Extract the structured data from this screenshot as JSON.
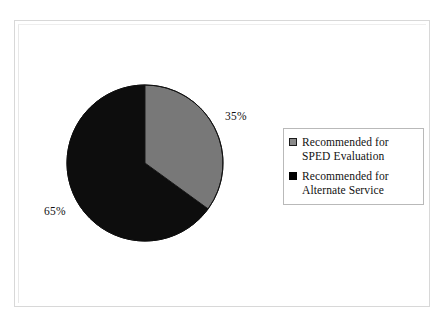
{
  "chart_data": {
    "type": "pie",
    "title": "",
    "categories": [
      "Recommended for SPED Evaluation",
      "Recommended for Alternate Service"
    ],
    "values": [
      35,
      65
    ],
    "unit": "%",
    "slices": [
      {
        "label": "Recommended for SPED Evaluation",
        "value": 35,
        "value_label": "35%",
        "color": "#787878",
        "start_angle_deg": 0,
        "sweep_deg": 126
      },
      {
        "label": "Recommended for Alternate Service",
        "value": 65,
        "value_label": "65%",
        "color": "#0d0d0d",
        "start_angle_deg": 126,
        "sweep_deg": 234
      }
    ],
    "legend": {
      "position": "right",
      "entries": [
        {
          "label": "Recommended for SPED Evaluation",
          "swatch": "gray-outlined-square",
          "color": "#8a8a8a"
        },
        {
          "label": "Recommended for Alternate Service",
          "swatch": "black-filled-square",
          "color": "#000000"
        }
      ]
    },
    "grid": false,
    "xlabel": "",
    "ylabel": "",
    "start_angle_note": "first slice begins at 12 o'clock, sweeping clockwise"
  },
  "labels": {
    "sped_percent": "35%",
    "alternate_percent": "65%"
  },
  "legend": {
    "entries": [
      {
        "line1": "Recommended for SPED",
        "line2": "Evaluation"
      },
      {
        "line1": "Recommended for",
        "line2": "Alternate Service"
      }
    ]
  },
  "colors": {
    "slice_gray": "#787878",
    "slice_black": "#0d0d0d",
    "outline": "#1a1a1a",
    "page_frame": "#d8d8d8",
    "legend_border": "#b9b9b9"
  }
}
